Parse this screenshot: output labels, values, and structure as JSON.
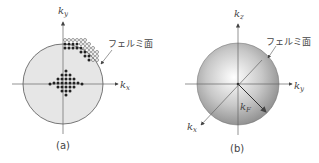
{
  "panel_a": {
    "caption": "(a)",
    "axis_x_label": "k",
    "axis_x_sub": "x",
    "axis_y_label": "k",
    "axis_y_sub": "y",
    "fermi_label": "フェルミ面",
    "circle_fill": "#e6e6e6",
    "dot_color": "#222222"
  },
  "panel_b": {
    "caption": "(b)",
    "axis_z_label": "k",
    "axis_z_sub": "z",
    "axis_y_label": "k",
    "axis_y_sub": "y",
    "axis_x_label": "k",
    "axis_x_sub": "x",
    "radius_label": "k",
    "radius_sub": "F",
    "fermi_label": "フェルミ面"
  }
}
